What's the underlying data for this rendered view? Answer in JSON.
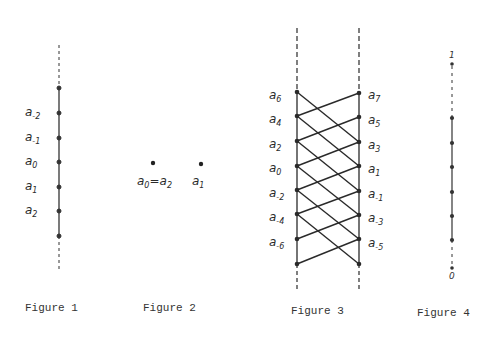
{
  "figures": [
    {
      "caption": "Figure 1",
      "labels": [
        {
          "base": "a",
          "sub": "-2"
        },
        {
          "base": "a",
          "sub": "-1"
        },
        {
          "base": "a",
          "sub": "0"
        },
        {
          "base": "a",
          "sub": "1"
        },
        {
          "base": "a",
          "sub": "2"
        }
      ]
    },
    {
      "caption": "Figure 2",
      "labels": [
        {
          "base": "a",
          "sub": "0",
          "eq": "=a",
          "sub2": "2"
        },
        {
          "base": "a",
          "sub": "1"
        }
      ]
    },
    {
      "caption": "Figure 3",
      "left_labels": [
        {
          "base": "a",
          "sub": "6"
        },
        {
          "base": "a",
          "sub": "4"
        },
        {
          "base": "a",
          "sub": "2"
        },
        {
          "base": "a",
          "sub": "0"
        },
        {
          "base": "a",
          "sub": "-2"
        },
        {
          "base": "a",
          "sub": "-4"
        },
        {
          "base": "a",
          "sub": "-6"
        }
      ],
      "right_labels": [
        {
          "base": "a",
          "sub": "7"
        },
        {
          "base": "a",
          "sub": "5"
        },
        {
          "base": "a",
          "sub": "3"
        },
        {
          "base": "a",
          "sub": "1"
        },
        {
          "base": "a",
          "sub": "-1"
        },
        {
          "base": "a",
          "sub": "-3"
        },
        {
          "base": "a",
          "sub": "-5"
        }
      ]
    },
    {
      "caption": "Figure 4",
      "top_label": "1",
      "bottom_label": "0"
    }
  ]
}
